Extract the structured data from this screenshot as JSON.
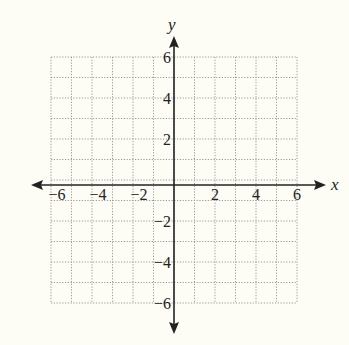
{
  "diagram": {
    "type": "coordinate-grid",
    "x_axis": {
      "label": "x",
      "min": -6,
      "max": 6,
      "tick_labels": [
        "-6",
        "-4",
        "-2",
        "2",
        "4",
        "6"
      ]
    },
    "y_axis": {
      "label": "y",
      "min": -6,
      "max": 6,
      "tick_labels": [
        "6",
        "4",
        "2",
        "-2",
        "-4",
        "-6"
      ]
    },
    "grid": {
      "step": 1,
      "style": "dotted",
      "color": "#999999"
    },
    "colors": {
      "background": "#fdfdf6",
      "axis": "#222222"
    }
  },
  "chart_data": {
    "type": "scatter",
    "title": "",
    "xlabel": "x",
    "ylabel": "y",
    "xlim": [
      -6,
      6
    ],
    "ylim": [
      -6,
      6
    ],
    "x_ticks": [
      -6,
      -4,
      -2,
      2,
      4,
      6
    ],
    "y_ticks": [
      -6,
      -4,
      -2,
      2,
      4,
      6
    ],
    "grid": true,
    "series": []
  }
}
